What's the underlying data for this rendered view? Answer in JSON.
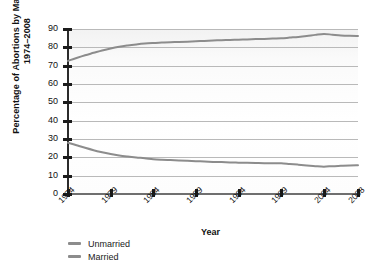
{
  "chart_data": {
    "type": "line",
    "title": "",
    "ylabel": "Percentage of Abortions by Marital Status, 1974–2008",
    "ylabel_line1": "Percentage of Abortions by Marital Status,",
    "ylabel_line2": "1974–2008",
    "xlabel": "Year",
    "xlim": [
      1974,
      2008
    ],
    "ylim": [
      0,
      90
    ],
    "ytick_step": 10,
    "grid": true,
    "legend_position": "below-left",
    "categories": [
      1974,
      1975,
      1976,
      1977,
      1978,
      1979,
      1980,
      1981,
      1982,
      1983,
      1984,
      1985,
      1986,
      1987,
      1988,
      1989,
      1990,
      1991,
      1992,
      1993,
      1994,
      1995,
      1996,
      1997,
      1998,
      1999,
      2000,
      2001,
      2002,
      2003,
      2004,
      2005,
      2006,
      2007,
      2008
    ],
    "xticks": [
      "1974",
      "1979",
      "1984",
      "1989",
      "1994",
      "1999",
      "2004",
      "2008"
    ],
    "yticks": [
      "0",
      "10",
      "20",
      "30",
      "40",
      "50",
      "60",
      "70",
      "80",
      "90"
    ],
    "series": [
      {
        "name": "Unmarried",
        "color": "#8c8c8c",
        "values": [
          72.6,
          74.2,
          75.7,
          77.0,
          78.3,
          79.4,
          80.3,
          81.0,
          81.6,
          82.1,
          82.4,
          82.6,
          82.8,
          82.9,
          83.1,
          83.3,
          83.5,
          83.7,
          83.9,
          84.0,
          84.2,
          84.3,
          84.5,
          84.6,
          84.8,
          84.9,
          85.3,
          85.7,
          86.2,
          86.8,
          87.3,
          86.9,
          86.5,
          86.3,
          86.2
        ]
      },
      {
        "name": "Married",
        "color": "#8c8c8c",
        "values": [
          28.0,
          26.6,
          25.2,
          23.9,
          22.8,
          21.8,
          21.0,
          20.4,
          19.9,
          19.5,
          19.0,
          18.7,
          18.5,
          18.3,
          18.1,
          17.9,
          17.7,
          17.5,
          17.4,
          17.2,
          17.1,
          17.0,
          16.9,
          16.8,
          16.8,
          16.8,
          16.4,
          16.0,
          15.6,
          15.2,
          14.9,
          15.2,
          15.4,
          15.6,
          15.7
        ]
      }
    ]
  },
  "legend": {
    "items": [
      {
        "label": "Unmarried",
        "color": "#8c8c8c"
      },
      {
        "label": "Married",
        "color": "#8c8c8c"
      }
    ]
  },
  "axes": {
    "x_title": "Year",
    "y_title_line1": "Percentage of Abortions by Marital Status,",
    "y_title_line2": "1974–2008"
  },
  "colors": {
    "line": "#8c8c8c",
    "grid": "#b9b9b9",
    "axis": "#1c1c1c",
    "plot_bg": "#f7f7f7",
    "page_bg": "#ffffff",
    "text": "#111111"
  }
}
